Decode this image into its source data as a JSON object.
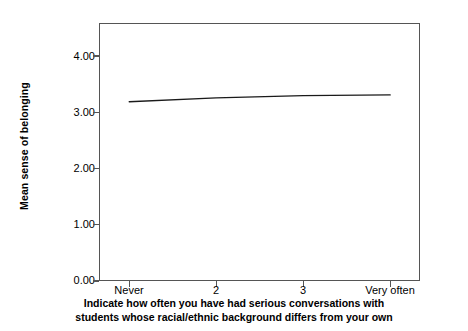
{
  "chart_data": {
    "type": "line",
    "title": "",
    "subtitle": "",
    "xlabel": "Indicate how often you have had serious conversations with students whose racial/ethnic background differs from your own",
    "xlabel_line1": "Indicate how often you have had serious conversations with",
    "xlabel_line2": "students whose racial/ethnic background differs from your own",
    "ylabel": "Mean sense of belonging",
    "categories": [
      "Never",
      "2",
      "3",
      "Very often"
    ],
    "values": [
      3.18,
      3.25,
      3.29,
      3.3
    ],
    "series": [
      {
        "name": "Mean sense of belonging",
        "values": [
          3.18,
          3.25,
          3.29,
          3.3
        ]
      }
    ],
    "ylim": [
      0.0,
      4.5
    ],
    "yticks": [
      0.0,
      1.0,
      2.0,
      3.0,
      4.0
    ],
    "ytick_labels": [
      "0.00",
      "1.00",
      "2.00",
      "3.00",
      "4.00"
    ],
    "grid": false,
    "legend": false,
    "legend_position": "none",
    "line_color": "#1a1a1a",
    "frame_color": "#555555",
    "background_color": "#ffffff"
  }
}
